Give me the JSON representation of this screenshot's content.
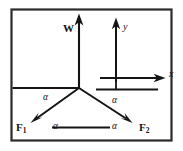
{
  "figure": {
    "kind": "force-vector-diagram",
    "border_color": "#2b2b2b",
    "line_color": "#141414",
    "background": "#ffffff",
    "vectors": {
      "weight": {
        "label": "W",
        "direction": "up",
        "angle_deg": 90
      },
      "force_left": {
        "label": "F",
        "subscript": "1",
        "direction": "down-left",
        "angle_deg": 210
      },
      "force_right": {
        "label": "F",
        "subscript": "2",
        "direction": "down-right",
        "angle_deg": 330
      }
    },
    "axes": {
      "x_label": "x",
      "y_label": "y"
    },
    "angle_labels": [
      {
        "id": "alpha-upper-left",
        "text": "α"
      },
      {
        "id": "alpha-upper-right",
        "text": "α"
      },
      {
        "id": "alpha-bottom-left",
        "text": "α"
      },
      {
        "id": "alpha-bottom-right",
        "text": "α"
      }
    ]
  }
}
